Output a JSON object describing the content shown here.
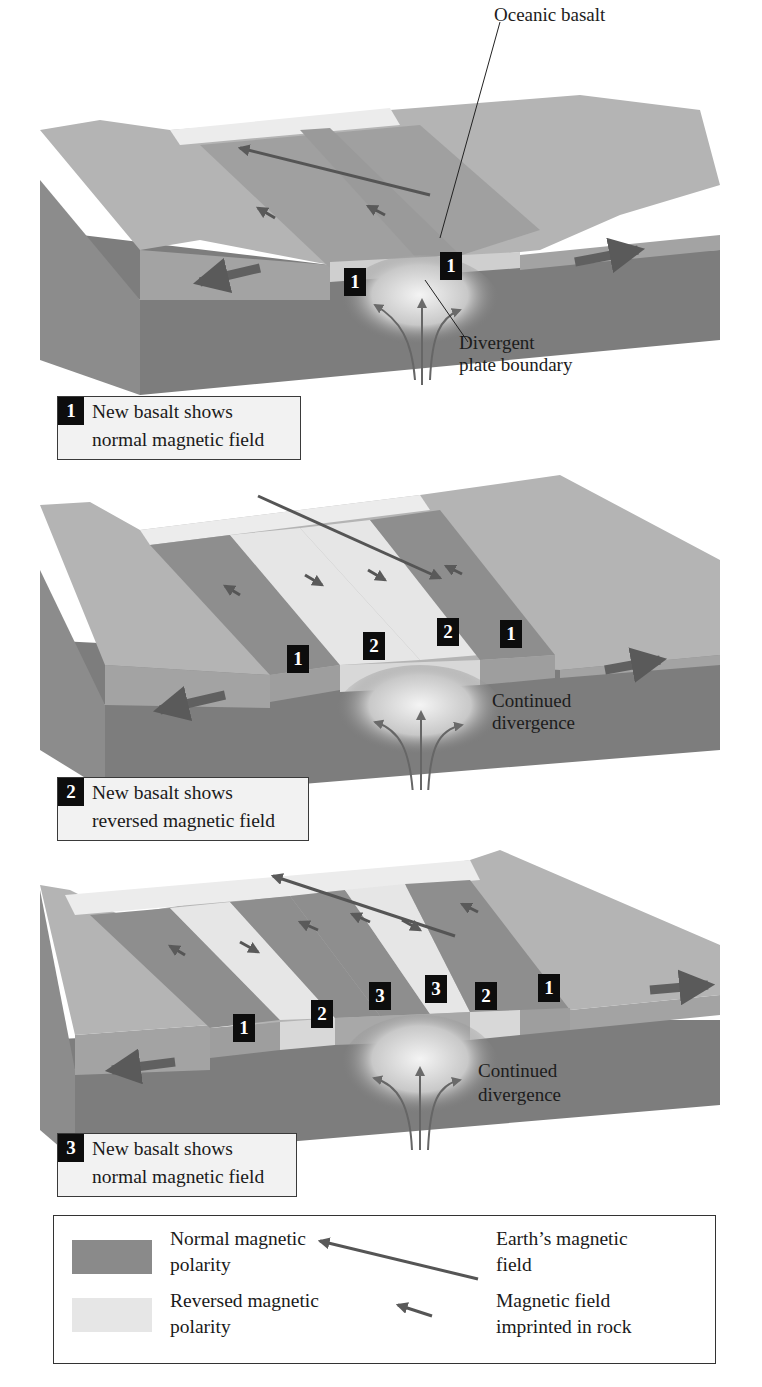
{
  "figure": {
    "colors": {
      "normal_polarity": "#8a8a8a",
      "reversed_polarity": "#e4e4e4",
      "mantle": "#7a7a7a",
      "crust_side": "#a6a6a6",
      "badge_bg": "#0d0d0d",
      "caption_bg": "#f2f2f2"
    }
  },
  "panel1": {
    "callout_oceanic_basalt": "Oceanic basalt",
    "callout_boundary_line1": "Divergent",
    "callout_boundary_line2": "plate boundary",
    "badges": [
      "1",
      "1"
    ],
    "caption": {
      "number": "1",
      "line1": "New basalt shows",
      "line2": "normal magnetic field"
    }
  },
  "panel2": {
    "callout_line1": "Continued",
    "callout_line2": "divergence",
    "badges": [
      "1",
      "2",
      "2",
      "1"
    ],
    "caption": {
      "number": "2",
      "line1": "New basalt shows",
      "line2": "reversed magnetic field"
    }
  },
  "panel3": {
    "callout_line1": "Continued",
    "callout_line2": "divergence",
    "badges": [
      "1",
      "2",
      "3",
      "3",
      "2",
      "1"
    ],
    "caption": {
      "number": "3",
      "line1": "New basalt shows",
      "line2": "normal magnetic field"
    }
  },
  "legend": {
    "normal_line1": "Normal magnetic",
    "normal_line2": "polarity",
    "reversed_line1": "Reversed magnetic",
    "reversed_line2": "polarity",
    "earth_field_line1": "Earth’s magnetic",
    "earth_field_line2": "field",
    "imprinted_line1": "Magnetic field",
    "imprinted_line2": "imprinted in rock",
    "icons": [
      "long-arrow-icon",
      "short-arrow-icon"
    ]
  }
}
